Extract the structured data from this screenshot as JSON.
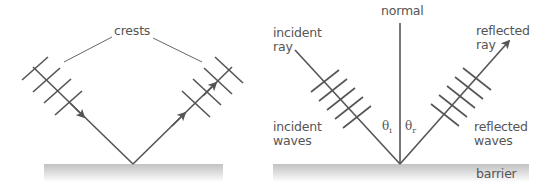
{
  "left_diagram": {
    "label_crests": "crests"
  },
  "right_diagram": {
    "label_normal": "normal",
    "label_incident_ray_1": "incident",
    "label_incident_ray_2": "ray",
    "label_reflected_ray_1": "reflected",
    "label_reflected_ray_2": "ray",
    "label_incident_waves_1": "incident",
    "label_incident_waves_2": "waves",
    "label_reflected_waves_1": "reflected",
    "label_reflected_waves_2": "waves",
    "label_barrier": "barrier",
    "angle_incidence_symbol": "θ",
    "angle_incidence_sub": "i",
    "angle_reflection_symbol": "θ",
    "angle_reflection_sub": "r"
  },
  "colors": {
    "line": "#555555",
    "text": "#555555",
    "barrier_top": "#c4c4c4",
    "barrier_bottom": "#ffffff"
  }
}
